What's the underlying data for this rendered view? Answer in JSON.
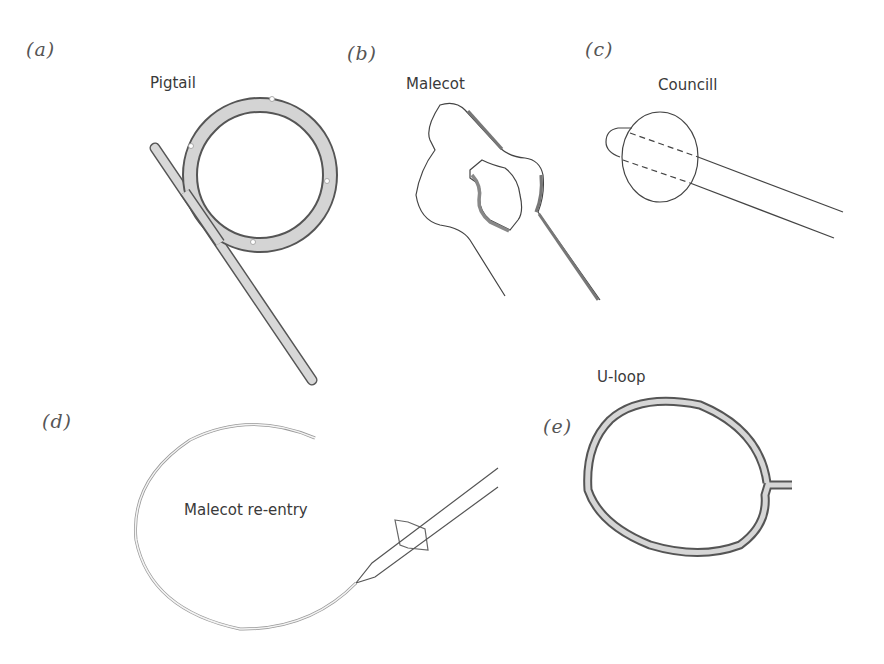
{
  "figure": {
    "panels": [
      {
        "letter": "(a)",
        "name": "Pigtail"
      },
      {
        "letter": "(b)",
        "name": "Malecot"
      },
      {
        "letter": "(c)",
        "name": "Councill"
      },
      {
        "letter": "(d)",
        "name": "Malecot re-entry"
      },
      {
        "letter": "(e)",
        "name": "U-loop"
      }
    ]
  },
  "colors": {
    "tube_fill": "#d4d4d4",
    "stroke": "#555555",
    "background": "#ffffff"
  }
}
